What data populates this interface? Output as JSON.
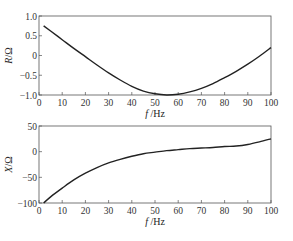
{
  "chart_data": [
    {
      "type": "line",
      "title": "",
      "xlabel": "f /Hz",
      "ylabel": "R/Ω",
      "xlim": [
        0,
        100
      ],
      "ylim": [
        -1.0,
        1.0
      ],
      "xticks": [
        0,
        10,
        20,
        30,
        40,
        50,
        60,
        70,
        80,
        90,
        100
      ],
      "yticks": [
        -1.0,
        -0.5,
        0,
        0.5,
        1.0
      ],
      "ytick_labels": [
        "−1.0",
        "−0.5",
        "0",
        "0.5",
        "1.0"
      ],
      "grid": false,
      "series": [
        {
          "name": "R",
          "x": [
            2,
            5,
            10,
            15,
            20,
            25,
            30,
            35,
            40,
            45,
            50,
            55,
            60,
            65,
            70,
            75,
            80,
            85,
            90,
            95,
            100
          ],
          "values": [
            0.75,
            0.62,
            0.4,
            0.18,
            -0.03,
            -0.24,
            -0.44,
            -0.62,
            -0.78,
            -0.9,
            -0.97,
            -1.0,
            -0.98,
            -0.92,
            -0.83,
            -0.71,
            -0.56,
            -0.4,
            -0.22,
            -0.02,
            0.2
          ]
        }
      ]
    },
    {
      "type": "line",
      "title": "",
      "xlabel": "f /Hz",
      "ylabel": "X/Ω",
      "xlim": [
        0,
        100
      ],
      "ylim": [
        -100,
        50
      ],
      "xticks": [
        0,
        10,
        20,
        30,
        40,
        50,
        60,
        70,
        80,
        90,
        100
      ],
      "yticks": [
        -100,
        -50,
        0,
        50
      ],
      "ytick_labels": [
        "−100",
        "−50",
        "0",
        "50"
      ],
      "grid": false,
      "series": [
        {
          "name": "X",
          "x": [
            2,
            5,
            10,
            15,
            20,
            25,
            30,
            35,
            40,
            45,
            50,
            55,
            60,
            65,
            70,
            75,
            80,
            85,
            90,
            95,
            100
          ],
          "values": [
            -100,
            -88,
            -71,
            -55,
            -42,
            -31,
            -22,
            -15,
            -9,
            -4,
            -1,
            2,
            4,
            6,
            7,
            8,
            10,
            11,
            14,
            19,
            25
          ]
        }
      ]
    }
  ]
}
